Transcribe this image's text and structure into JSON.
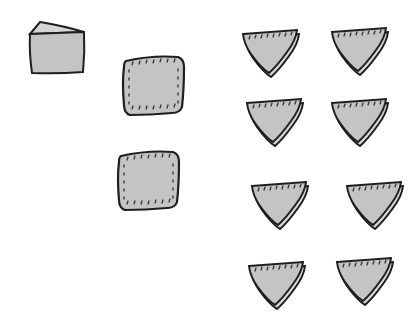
{
  "illustration": {
    "description": "Hand-drawn illustration of a cheese wedge and sandwich pieces: one whole block, two square sandwiches, eight triangular sandwich halves",
    "colors": {
      "fill": "#c4c4c4",
      "fill_light": "#d6d6d6",
      "stroke": "#1e1e1e",
      "background": "#ffffff"
    },
    "items": [
      {
        "type": "block",
        "label": "cheese-block",
        "x": 28,
        "y": 22
      },
      {
        "type": "square",
        "label": "square-sandwich-1",
        "x": 122,
        "y": 55
      },
      {
        "type": "square",
        "label": "square-sandwich-2",
        "x": 117,
        "y": 150
      },
      {
        "type": "triangle",
        "label": "triangle-sandwich-1",
        "x": 241,
        "y": 28
      },
      {
        "type": "triangle",
        "label": "triangle-sandwich-2",
        "x": 330,
        "y": 26
      },
      {
        "type": "triangle",
        "label": "triangle-sandwich-3",
        "x": 245,
        "y": 97
      },
      {
        "type": "triangle",
        "label": "triangle-sandwich-4",
        "x": 330,
        "y": 97
      },
      {
        "type": "triangle",
        "label": "triangle-sandwich-5",
        "x": 250,
        "y": 180
      },
      {
        "type": "triangle",
        "label": "triangle-sandwich-6",
        "x": 345,
        "y": 180
      },
      {
        "type": "triangle",
        "label": "triangle-sandwich-7",
        "x": 247,
        "y": 260
      },
      {
        "type": "triangle",
        "label": "triangle-sandwich-8",
        "x": 335,
        "y": 256
      }
    ]
  }
}
